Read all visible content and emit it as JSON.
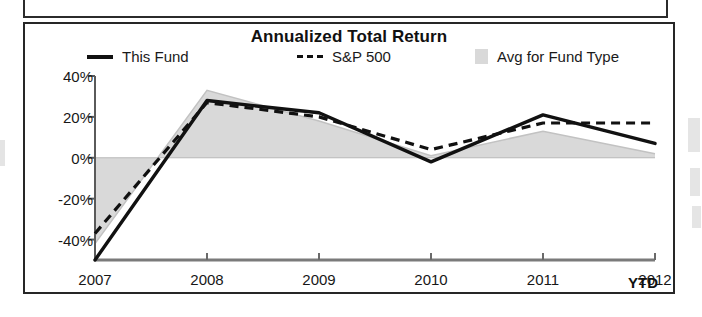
{
  "chart_data": {
    "type": "line",
    "title": "Annualized Total Return",
    "xlabel": "",
    "ylabel": "",
    "x": [
      "2007",
      "2008",
      "2009",
      "2010",
      "2011",
      "2012"
    ],
    "categories": [
      "2007",
      "2008",
      "2009",
      "2010",
      "2011",
      "2012"
    ],
    "x_tick_labels": [
      "2007",
      "2008",
      "2009",
      "2010",
      "2011",
      "2012"
    ],
    "x_axis_note": "YTD",
    "y_tick_labels": [
      "40%",
      "20%",
      "0%",
      "-20%",
      "-40%"
    ],
    "y_tick_values": [
      40,
      20,
      0,
      -20,
      -40
    ],
    "ylim": [
      -50,
      40
    ],
    "xlim": [
      "2007",
      "2012"
    ],
    "grid": false,
    "legend_position": "top",
    "series": [
      {
        "name": "This Fund",
        "style": "solid-line",
        "color": "#111111",
        "values": [
          -50,
          28,
          22,
          -2,
          21,
          7
        ]
      },
      {
        "name": "S&P 500",
        "style": "dashed-line",
        "color": "#111111",
        "values": [
          -37,
          27,
          20,
          4,
          17,
          17
        ]
      },
      {
        "name": "Avg for Fund Type",
        "style": "shaded-area",
        "color": "#d9d9d9",
        "values": [
          -42,
          33,
          18,
          1,
          13,
          2
        ]
      }
    ],
    "legend": [
      {
        "label": "This Fund",
        "marker": "solid-line"
      },
      {
        "label": "S&P 500",
        "marker": "dashed-line"
      },
      {
        "label": "Avg for Fund Type",
        "marker": "shaded-area"
      }
    ]
  },
  "legend": {
    "this_fund_label": "This Fund",
    "sp500_label": "S&P 500",
    "avg_fund_type_label": "Avg for Fund Type"
  },
  "axis": {
    "y_labels": [
      "40%",
      "20%",
      "0%",
      "-20%",
      "-40%"
    ],
    "x_labels": [
      "2007",
      "2008",
      "2009",
      "2010",
      "2011",
      "2012"
    ],
    "ytd_note": "YTD"
  },
  "colors": {
    "fund_line": "#111111",
    "benchmark_line": "#111111",
    "area_fill": "#d9d9d9",
    "panel_border": "#262626",
    "axis": "#5a5a5a"
  }
}
